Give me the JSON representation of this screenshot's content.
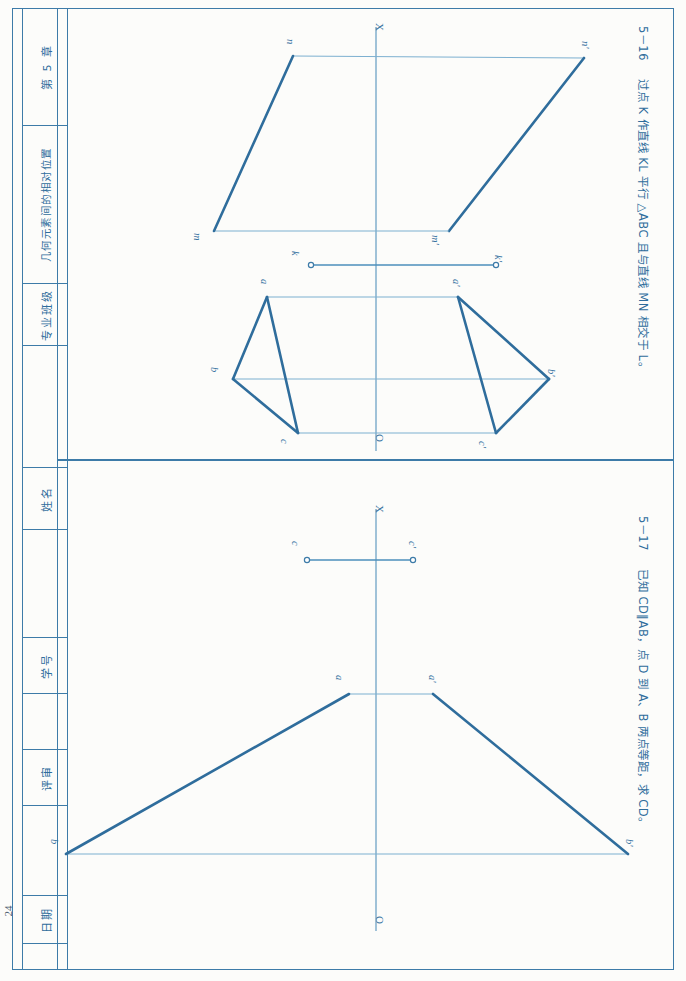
{
  "page": {
    "number": "24",
    "orientation": "content rotated 90 degrees clockwise"
  },
  "title_block": {
    "chapter": "第 5 章",
    "chapter_title": "几何元素间的相对位置",
    "fields": [
      {
        "label": "专业班级",
        "value": ""
      },
      {
        "label": "姓名",
        "value": ""
      },
      {
        "label": "学号",
        "value": ""
      },
      {
        "label": "评审",
        "value": ""
      },
      {
        "label": "日期",
        "value": ""
      }
    ]
  },
  "problems": [
    {
      "id": "5-16",
      "number": "5－16",
      "text": "过点 K 作直线 KL 平行 △ABC 且与直线 MN 相交于 L。"
    },
    {
      "id": "5-17",
      "number": "5－17",
      "text": "已知 CD∥AB，点 D 到 A、B 两点等距，求 CD。"
    }
  ],
  "drawings": {
    "top": {
      "axis_label": "X",
      "origin_label": "O",
      "point_labels": [
        "n",
        "n'",
        "m",
        "m'",
        "k",
        "k'",
        "a",
        "a'",
        "b",
        "b'",
        "c",
        "c'"
      ],
      "figures": [
        {
          "name": "plane MN parallelogram",
          "vertices": [
            "n",
            "n'",
            "m'",
            "m"
          ]
        },
        {
          "name": "point K projections",
          "vertices": [
            "k",
            "k'"
          ]
        },
        {
          "name": "triangle abc front view",
          "vertices": [
            "a",
            "b",
            "c"
          ]
        },
        {
          "name": "triangle a'b'c' top view",
          "vertices": [
            "a'",
            "b'",
            "c'"
          ]
        }
      ]
    },
    "bottom": {
      "axis_label": "X",
      "origin_label": "O",
      "point_labels": [
        "c",
        "c'",
        "a",
        "a'",
        "b",
        "b'"
      ],
      "figures": [
        {
          "name": "segment cc'",
          "vertices": [
            "c",
            "c'"
          ]
        },
        {
          "name": "line ab front view",
          "vertices": [
            "a",
            "b"
          ]
        },
        {
          "name": "line a'b' top view",
          "vertices": [
            "a'",
            "b'"
          ]
        }
      ]
    }
  },
  "colors": {
    "ink": "#2f6d9c",
    "thin_line": "#7db0d0",
    "frame": "#3d7ba8",
    "paper": "#fcfcfa"
  }
}
